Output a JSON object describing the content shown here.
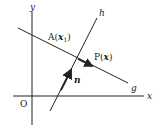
{
  "diagram": {
    "axes": {
      "x_label": "x",
      "y_label": "y",
      "origin_label": "O"
    },
    "lines": [
      {
        "name": "g",
        "label": "g"
      },
      {
        "name": "h",
        "label": "h"
      }
    ],
    "points": [
      {
        "name": "A",
        "label_prefix": "A(",
        "vector": "x",
        "subscript": "1",
        "label_suffix": ")"
      },
      {
        "name": "P",
        "label_prefix": "P(",
        "vector": "x",
        "label_suffix": ")"
      }
    ],
    "vectors": [
      {
        "name": "n",
        "label": "n"
      }
    ],
    "colors": {
      "ink": "#222222",
      "background": "#ffffff"
    }
  }
}
